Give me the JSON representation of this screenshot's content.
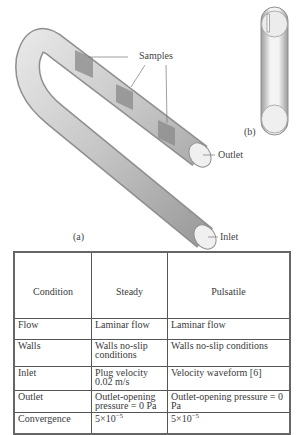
{
  "figure": {
    "labels": {
      "samples": "Samples",
      "outlet": "Outlet",
      "inlet": "Inlet",
      "panel_a": "(a)",
      "panel_b": "(b)"
    }
  },
  "table": {
    "headers": [
      "Condition",
      "Steady",
      "Pulsatile"
    ],
    "rows": [
      {
        "condition": "Flow",
        "steady": "Laminar flow",
        "pulsatile": "Laminar flow"
      },
      {
        "condition": "Walls",
        "steady": "Walls no-slip conditions",
        "pulsatile": "Walls no-slip conditions"
      },
      {
        "condition": "Inlet",
        "steady": "Plug velocity 0.02 m/s",
        "pulsatile": "Velocity waveform [6]"
      },
      {
        "condition": "Outlet",
        "steady": "Outlet-opening pressure = 0 Pa",
        "pulsatile": "Outlet-opening pressure = 0 Pa"
      },
      {
        "condition": "Convergence",
        "steady_base": "5×10",
        "steady_exp": "−5",
        "pulsatile_base": "5×10",
        "pulsatile_exp": "−5"
      }
    ]
  }
}
